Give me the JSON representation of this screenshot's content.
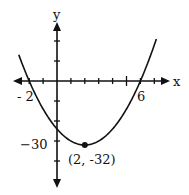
{
  "chart_data": {
    "type": "line",
    "title": "",
    "xlabel": "x",
    "ylabel": "y",
    "function": "y = 2(x - 2)^2 - 32",
    "x": [
      -3,
      -2,
      -1,
      0,
      1,
      2,
      3,
      4,
      5,
      6,
      7
    ],
    "series": [
      {
        "name": "parabola",
        "values": [
          18,
          0,
          -14,
          -24,
          -30,
          -32,
          -30,
          -24,
          -14,
          0,
          18
        ]
      }
    ],
    "x_intercepts": [
      -2,
      6
    ],
    "vertex": {
      "x": 2,
      "y": -32,
      "label": "(2, -32)"
    },
    "tick_labels": {
      "x": [
        "- 2",
        "6"
      ],
      "y": [
        "−30"
      ]
    },
    "xlim": [
      -3,
      8
    ],
    "ylim": [
      -45,
      40
    ],
    "x_tick_step": 1,
    "y_tick_step": 10,
    "grid": false,
    "legend": null
  },
  "colors": {
    "ink": "#111111",
    "background": "#ffffff"
  }
}
